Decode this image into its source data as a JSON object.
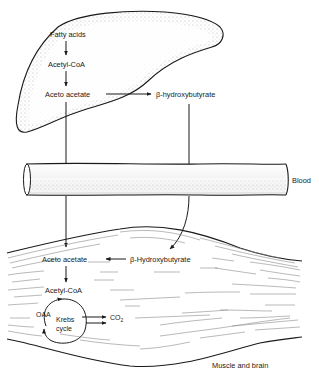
{
  "diagram": {
    "colors": {
      "ink": "#1a1a1a",
      "stipple": "#c8c8c8",
      "fiber": "#8a8a8a",
      "background": "#ffffff"
    },
    "liver": {
      "labels": {
        "fatty_acids": "Fatty acids",
        "acetyl_coa": "Acetyl-CoA",
        "acetoacetate": "Aceto acetate",
        "hydroxybutyrate": "β-hydroxybutyrate"
      }
    },
    "blood": {
      "label": "Blood"
    },
    "muscle": {
      "labels": {
        "acetoacetate": "Aceto acetate",
        "hydroxybutyrate": "β-Hydroxybutyrate",
        "acetyl_coa": "Acetyl-CoA",
        "oaa": "OAA",
        "krebs_line1": "Krebs",
        "krebs_line2": "cycle",
        "co2": "CO",
        "co2_sub": "2"
      },
      "tissue_label": "Muscle and brain"
    }
  }
}
